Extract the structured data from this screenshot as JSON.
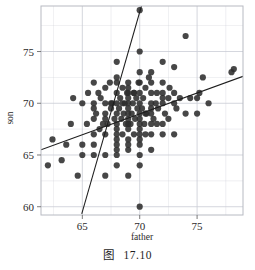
{
  "figure": {
    "caption_label": "图",
    "caption_number": "17.10"
  },
  "chart_data": {
    "type": "scatter",
    "title": "",
    "subtitle": "",
    "xlabel": "father",
    "ylabel": "son",
    "xlim": [
      61.4,
      79.0
    ],
    "ylim": [
      59.2,
      79.4
    ],
    "xticks": [
      65,
      70,
      75
    ],
    "xtick_labels": [
      "65",
      "70",
      "75"
    ],
    "yticks": [
      60,
      65,
      70,
      75
    ],
    "ytick_labels": [
      "60",
      "65",
      "70",
      "75"
    ],
    "grid": true,
    "grid_color": "#c9ccd4",
    "frame_color": "#b7bac2",
    "legend": "none",
    "point_color": "#2e2e2e",
    "point_size": 3.1,
    "point_opacity": 0.88,
    "line_color": "#1d1d1d",
    "series": [
      {
        "name": "father-son heights",
        "x": [
          62.0,
          62.4,
          63.2,
          63.6,
          64.0,
          64.2,
          64.6,
          65.0,
          65.0,
          65.0,
          65.4,
          65.5,
          66.0,
          66.0,
          66.0,
          66.0,
          66.0,
          66.0,
          66.2,
          66.4,
          66.5,
          66.6,
          66.8,
          67.0,
          67.0,
          67.0,
          67.0,
          67.0,
          67.0,
          67.2,
          67.4,
          67.5,
          67.6,
          67.8,
          68.0,
          68.0,
          68.0,
          68.0,
          68.0,
          68.0,
          68.0,
          68.0,
          68.0,
          68.0,
          68.0,
          68.0,
          68.2,
          68.3,
          68.4,
          68.5,
          68.5,
          68.6,
          68.7,
          68.8,
          68.9,
          69.0,
          69.0,
          69.0,
          69.0,
          69.0,
          69.0,
          69.0,
          69.0,
          69.0,
          69.0,
          69.0,
          69.0,
          69.2,
          69.3,
          69.4,
          69.5,
          69.5,
          69.6,
          69.7,
          69.8,
          69.9,
          70.0,
          70.0,
          70.0,
          70.0,
          70.0,
          70.0,
          70.0,
          70.0,
          70.0,
          70.0,
          70.0,
          70.0,
          70.0,
          70.0,
          70.2,
          70.3,
          70.4,
          70.5,
          70.5,
          70.6,
          70.8,
          71.0,
          71.0,
          71.0,
          71.0,
          71.0,
          71.0,
          71.0,
          71.0,
          71.2,
          71.4,
          71.5,
          71.6,
          72.0,
          72.0,
          72.0,
          72.0,
          72.0,
          72.0,
          72.2,
          72.5,
          72.6,
          73.0,
          73.0,
          73.0,
          73.0,
          73.2,
          73.5,
          74.0,
          74.0,
          74.4,
          75.0,
          75.0,
          75.2,
          75.5,
          76.0,
          78.0,
          78.2,
          66.0,
          67.0,
          68.0,
          69.0,
          70.0,
          71.0,
          72.0,
          68.5,
          69.5,
          70.5,
          67.5,
          71.5,
          69.0,
          70.0,
          68.0,
          72.5
        ],
        "y": [
          64.0,
          66.5,
          64.5,
          66.0,
          68.0,
          70.5,
          63.0,
          65.0,
          66.0,
          70.0,
          68.0,
          71.0,
          65.0,
          66.0,
          67.0,
          68.5,
          70.0,
          72.0,
          69.0,
          71.0,
          67.5,
          70.5,
          68.0,
          63.0,
          65.0,
          67.0,
          69.0,
          70.0,
          71.5,
          68.0,
          72.0,
          69.5,
          70.0,
          68.5,
          64.0,
          65.0,
          65.5,
          66.0,
          67.0,
          67.5,
          68.0,
          69.0,
          70.0,
          71.0,
          72.0,
          74.0,
          69.5,
          70.5,
          68.5,
          67.0,
          71.5,
          69.0,
          70.0,
          68.0,
          71.0,
          63.0,
          65.5,
          66.5,
          67.5,
          68.0,
          68.5,
          69.0,
          69.5,
          70.0,
          70.5,
          71.0,
          72.0,
          68.0,
          69.0,
          70.0,
          67.0,
          71.0,
          68.5,
          70.5,
          69.5,
          72.0,
          60.0,
          64.0,
          65.0,
          66.0,
          66.5,
          67.0,
          68.0,
          69.0,
          70.0,
          71.0,
          72.0,
          73.0,
          75.0,
          79.0,
          69.5,
          70.5,
          68.0,
          67.0,
          71.5,
          69.0,
          72.5,
          65.5,
          67.0,
          68.0,
          69.0,
          70.0,
          71.0,
          72.0,
          73.0,
          68.5,
          70.0,
          71.0,
          69.5,
          67.0,
          68.0,
          70.0,
          71.0,
          72.0,
          74.0,
          69.0,
          70.5,
          71.5,
          67.0,
          70.0,
          71.0,
          73.5,
          69.5,
          70.5,
          69.0,
          76.5,
          70.5,
          69.0,
          70.5,
          71.0,
          72.5,
          70.0,
          73.0,
          73.3,
          69.5,
          68.5,
          66.5,
          66.0,
          67.5,
          69.5,
          70.5,
          70.0,
          71.0,
          69.0,
          70.0,
          68.0,
          71.5,
          68.5,
          72.5,
          68.5
        ]
      }
    ],
    "annotations": [
      {
        "name": "regression-line",
        "type": "line",
        "x": [
          61.4,
          79.0
        ],
        "y": [
          65.5,
          72.6
        ]
      },
      {
        "name": "sd-line",
        "type": "line",
        "x": [
          64.95,
          70.15
        ],
        "y": [
          59.3,
          79.4
        ]
      }
    ]
  }
}
